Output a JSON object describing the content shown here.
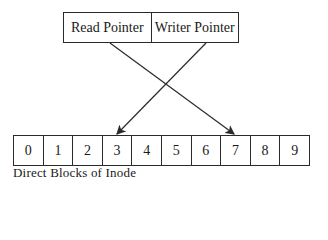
{
  "pointers": [
    {
      "label": "Read Pointer",
      "target_block": 7
    },
    {
      "label": "Writer Pointer",
      "target_block": 3
    }
  ],
  "blocks": [
    "0",
    "1",
    "2",
    "3",
    "4",
    "5",
    "6",
    "7",
    "8",
    "9"
  ],
  "caption": "Direct Blocks of Inode"
}
